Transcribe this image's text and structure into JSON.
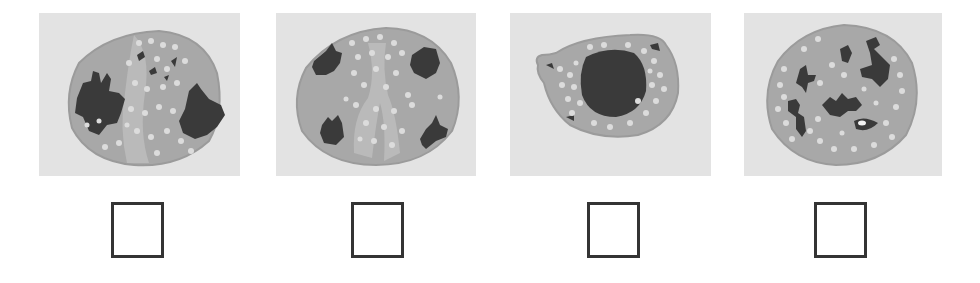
{
  "options": [
    {
      "id": "cell-1",
      "description": "Cell with two large dark irregular nuclear lobes at left and right, light granules throughout",
      "checked": false
    },
    {
      "id": "cell-2",
      "description": "Cell with four small dark nuclear lobes near the edges, light granules in the center",
      "checked": false
    },
    {
      "id": "cell-3",
      "description": "Oval cell with one large round dark central nucleus surrounded by light granules",
      "checked": false
    },
    {
      "id": "cell-4",
      "description": "Round cell with multiple small dark fragmented nuclear pieces and scattered light granules",
      "checked": false
    }
  ],
  "colors": {
    "panel_background": "#e3e3e3",
    "cytoplasm": "#a8a8a8",
    "cytoplasm_light": "#bababa",
    "granule": "#dcdcdc",
    "nucleus": "#3a3a3a",
    "checkbox_border": "#343434"
  }
}
